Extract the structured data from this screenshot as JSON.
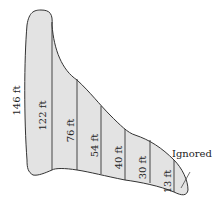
{
  "diagram": {
    "fill_color": "#e3e3e3",
    "stroke_color": "#333333",
    "measurements": [
      {
        "label": "146 ft"
      },
      {
        "label": "122 ft"
      },
      {
        "label": "76 ft"
      },
      {
        "label": "54 ft"
      },
      {
        "label": "40 ft"
      },
      {
        "label": "30 ft"
      },
      {
        "label": "13 ft"
      }
    ],
    "annotation": "Ignored"
  }
}
